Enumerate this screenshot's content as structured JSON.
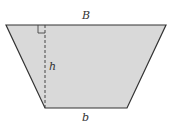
{
  "figure": {
    "shape": "trapezoid",
    "fill_color": "#d9d9d9",
    "stroke_color": "#333333",
    "labels": {
      "top_base": "B",
      "height": "h",
      "bottom_base": "b"
    },
    "right_angle_marker": true,
    "height_line_style": "dashed"
  }
}
